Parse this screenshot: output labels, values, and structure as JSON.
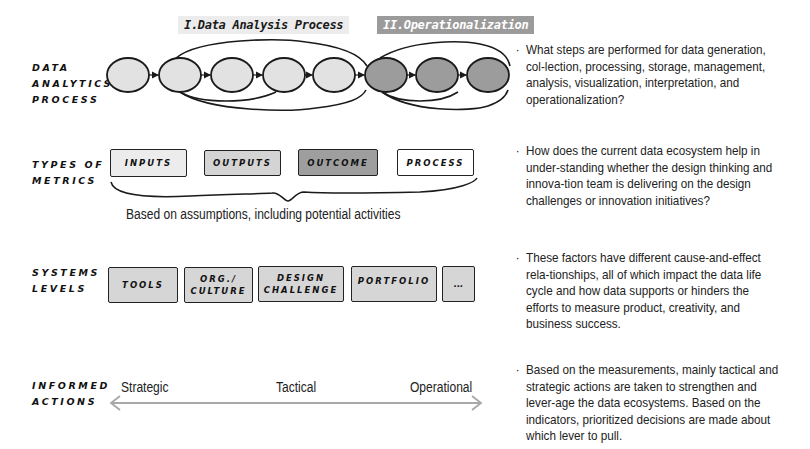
{
  "phases": {
    "phase1": "I.Data Analysis Process",
    "phase2": "II.Operationalization"
  },
  "rows": {
    "process": {
      "line1": "DATA",
      "line2": "ANALYTICS",
      "line3": "PROCESS"
    },
    "metrics": {
      "line1": "TYPES OF",
      "line2": "METRICS"
    },
    "systems": {
      "line1": "SYSTEMS",
      "line2": "LEVELS"
    },
    "actions": {
      "line1": "INFORMED",
      "line2": "ACTIONS"
    }
  },
  "process_nodes": [
    {
      "fill": "#e2e2e2"
    },
    {
      "fill": "#e2e2e2"
    },
    {
      "fill": "#e2e2e2"
    },
    {
      "fill": "#e2e2e2"
    },
    {
      "fill": "#e2e2e2"
    },
    {
      "fill": "#9c9c9c"
    },
    {
      "fill": "#9c9c9c"
    },
    {
      "fill": "#9c9c9c"
    }
  ],
  "metrics": [
    {
      "label": "INPUTS",
      "fill": "#ececec"
    },
    {
      "label": "OUTPUTS",
      "fill": "#d4d4d4"
    },
    {
      "label": "OUTCOME",
      "fill": "#9e9e9e"
    },
    {
      "label": "PROCESS",
      "fill": "#ffffff"
    }
  ],
  "metrics_caption": "Based on assumptions, including potential activities",
  "systems": [
    {
      "line1": "TOOLS",
      "line2": ""
    },
    {
      "line1": "ORG./",
      "line2": "CULTURE"
    },
    {
      "line1": "DESIGN",
      "line2": "CHALLENGE"
    },
    {
      "line1": "PORTFOLIO",
      "line2": ""
    },
    {
      "line1": "...",
      "line2": ""
    }
  ],
  "actions_scale": {
    "left": "Strategic",
    "middle": "Tactical",
    "right": "Operational"
  },
  "bullets": [
    "What steps are performed for data generation, col-lection, processing, storage, management, analysis, visualization, interpretation, and operationalization?",
    "How does the current data ecosystem help in under-standing whether the design thinking and innova-tion team is delivering on the design challenges or innovation initiatives?",
    "These factors have different cause-and-effect rela-tionships, all of which impact the data life cycle and how data supports or hinders the efforts to measure product, creativity, and business success.",
    "Based on the measurements, mainly tactical and strategic actions are taken to strengthen and lever-age the data ecosystems. Based on the indicators, prioritized decisions are made about which lever to pull."
  ],
  "colors": {
    "light_gray": "#e2e2e2",
    "dark_gray": "#9c9c9c",
    "arrow_gray": "#a8a8a8",
    "stroke": "#1a1a1a"
  }
}
